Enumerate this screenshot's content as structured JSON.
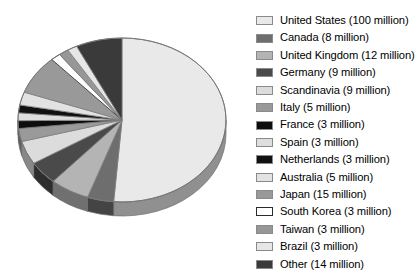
{
  "chart_data": {
    "type": "pie",
    "title": "",
    "units": "million",
    "total": 193,
    "legend_position": "right",
    "three_d": true,
    "categories": [
      "United States",
      "Canada",
      "United Kingdom",
      "Germany",
      "Scandinavia",
      "Italy",
      "France",
      "Spain",
      "Netherlands",
      "Australia",
      "Japan",
      "South Korea",
      "Taiwan",
      "Brazil",
      "Other"
    ],
    "values": [
      100,
      8,
      12,
      9,
      9,
      5,
      3,
      3,
      3,
      5,
      15,
      3,
      3,
      3,
      14
    ],
    "slices": [
      {
        "label": "United States",
        "value": 100,
        "value_text": "100 million",
        "legend_text": "United States (100 million)",
        "color": "#e9e9e9",
        "border": "#8a8a8a"
      },
      {
        "label": "Canada",
        "value": 8,
        "value_text": "8 million",
        "legend_text": "Canada (8 million)",
        "color": "#6e6e6e",
        "border": "#8a8a8a"
      },
      {
        "label": "United Kingdom",
        "value": 12,
        "value_text": "12 million",
        "legend_text": "United Kingdom (12 million)",
        "color": "#b4b4b4",
        "border": "#8a8a8a"
      },
      {
        "label": "Germany",
        "value": 9,
        "value_text": "9 million",
        "legend_text": "Germany (9 million)",
        "color": "#4a4a4a",
        "border": "#8a8a8a"
      },
      {
        "label": "Scandinavia",
        "value": 9,
        "value_text": "9 million",
        "legend_text": "Scandinavia (9 million)",
        "color": "#dcdcdc",
        "border": "#8a8a8a"
      },
      {
        "label": "Italy",
        "value": 5,
        "value_text": "5 million",
        "legend_text": "Italy (5 million)",
        "color": "#9a9a9a",
        "border": "#8a8a8a"
      },
      {
        "label": "France",
        "value": 3,
        "value_text": "3 million",
        "legend_text": "France (3 million)",
        "color": "#0d0d0d",
        "border": "#8a8a8a"
      },
      {
        "label": "Spain",
        "value": 3,
        "value_text": "3 million",
        "legend_text": "Spain (3 million)",
        "color": "#dedede",
        "border": "#8a8a8a"
      },
      {
        "label": "Netherlands",
        "value": 3,
        "value_text": "3 million",
        "legend_text": "Netherlands (3 million)",
        "color": "#111111",
        "border": "#8a8a8a"
      },
      {
        "label": "Australia",
        "value": 5,
        "value_text": "5 million",
        "legend_text": "Australia (5 million)",
        "color": "#e2e2e2",
        "border": "#8a8a8a"
      },
      {
        "label": "Japan",
        "value": 15,
        "value_text": "15 million",
        "legend_text": "Japan (15 million)",
        "color": "#999999",
        "border": "#8a8a8a"
      },
      {
        "label": "South Korea",
        "value": 3,
        "value_text": "3 million",
        "legend_text": "South Korea (3 million)",
        "color": "#ffffff",
        "border": "#2b2b2b"
      },
      {
        "label": "Taiwan",
        "value": 3,
        "value_text": "3 million",
        "legend_text": "Taiwan (3 million)",
        "color": "#979797",
        "border": "#8a8a8a"
      },
      {
        "label": "Brazil",
        "value": 3,
        "value_text": "3 million",
        "legend_text": "Brazil (3 million)",
        "color": "#e6e6e6",
        "border": "#8a8a8a"
      },
      {
        "label": "Other",
        "value": 14,
        "value_text": "14 million",
        "legend_text": "Other (14 million)",
        "color": "#3a3a3a",
        "border": "#8a8a8a"
      }
    ]
  },
  "legend": {
    "items": [
      {
        "label": "United States (100 million)"
      },
      {
        "label": "Canada (8 million)"
      },
      {
        "label": "United Kingdom (12 million)"
      },
      {
        "label": "Germany (9 million)"
      },
      {
        "label": "Scandinavia (9 million)"
      },
      {
        "label": "Italy (5 million)"
      },
      {
        "label": "France (3 million)"
      },
      {
        "label": "Spain (3 million)"
      },
      {
        "label": "Netherlands (3 million)"
      },
      {
        "label": "Australia (5 million)"
      },
      {
        "label": "Japan (15 million)"
      },
      {
        "label": "South Korea (3 million)"
      },
      {
        "label": "Taiwan (3 million)"
      },
      {
        "label": "Brazil (3 million)"
      },
      {
        "label": "Other (14 million)"
      }
    ]
  },
  "geometry": {
    "cx": 122,
    "cy": 120,
    "rx": 104,
    "ry": 82,
    "depth": 14,
    "start_angle_deg": -90,
    "direction": "clockwise"
  }
}
